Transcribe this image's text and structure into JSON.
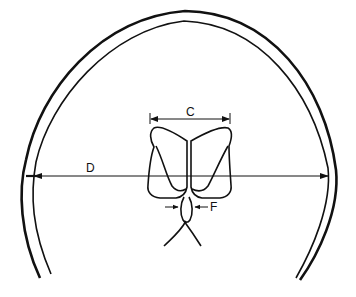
{
  "diagram": {
    "type": "schematic cross-section of skull with lateral ventricles and measurement markers",
    "labels": {
      "C": "C",
      "D": "D",
      "F": "F"
    },
    "measurements": [
      {
        "label": "C",
        "description": "width across frontal horns of lateral ventricles"
      },
      {
        "label": "D",
        "description": "internal diameter of skull at same level"
      },
      {
        "label": "F",
        "description": "width between arrows at midline structure below ventricles"
      }
    ],
    "colors": {
      "line": "#111111",
      "background": "#ffffff"
    }
  }
}
